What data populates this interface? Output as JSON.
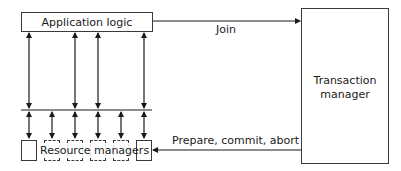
{
  "diagram": {
    "app_logic": {
      "label": "Application logic"
    },
    "transaction_manager": {
      "label_line1": "Transaction",
      "label_line2": "manager"
    },
    "resource_managers": {
      "label": "Resource managers",
      "count": 6
    },
    "edges": {
      "join": {
        "label": "Join",
        "from": "Application logic",
        "to": "Transaction manager"
      },
      "prepare": {
        "label": "Prepare, commit, abort",
        "from": "Transaction manager",
        "to": "Resource managers"
      }
    },
    "colors": {
      "line": "#1a1a1a",
      "box_border": "#3a3a3a",
      "background": "#ffffff"
    }
  }
}
